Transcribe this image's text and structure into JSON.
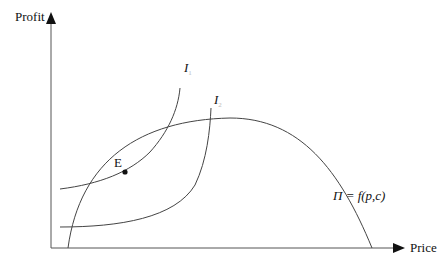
{
  "diagram": {
    "type": "economics-indifference-profit",
    "axes": {
      "y_label": "Profit",
      "x_label": "Price"
    },
    "curves": [
      {
        "id": "I1",
        "label": "I",
        "subscript": "1",
        "kind": "indifference-curve"
      },
      {
        "id": "I2",
        "label": "I",
        "subscript": "2",
        "kind": "indifference-curve"
      },
      {
        "id": "profit",
        "label": "Π = f(p,c)",
        "kind": "profit-function"
      }
    ],
    "points": [
      {
        "id": "E",
        "label": "E",
        "description": "tangency point of I1 and profit curve"
      }
    ],
    "colors": {
      "line": "#333333",
      "text": "#111111",
      "background": "#ffffff"
    }
  }
}
